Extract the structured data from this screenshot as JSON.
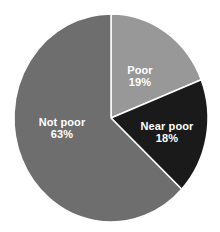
{
  "chart_data": {
    "type": "pie",
    "title": "",
    "subtitle": "",
    "xlabel": "",
    "ylabel": "",
    "legend_position": "none",
    "grid": false,
    "labels_inside_slices": true,
    "background_color": "#ffffff",
    "label_text_color": "#ffffff",
    "start_angle_deg": 0,
    "direction": "clockwise",
    "categories": [
      "Poor",
      "Near poor",
      "Not poor"
    ],
    "values": [
      19,
      18,
      63
    ],
    "value_suffix": "%",
    "colors": [
      "#989898",
      "#1a1a1a",
      "#6e6e6e"
    ],
    "slices": [
      {
        "name": "Poor",
        "value": 19,
        "value_label": "19%",
        "color": "#989898",
        "start_angle_deg": 0,
        "end_angle_deg": 68.4,
        "label_x": 140,
        "label_y": 76
      },
      {
        "name": "Near poor",
        "value": 18,
        "value_label": "18%",
        "color": "#1a1a1a",
        "start_angle_deg": 68.4,
        "end_angle_deg": 133.2,
        "label_x": 167,
        "label_y": 132
      },
      {
        "name": "Not poor",
        "value": 63,
        "value_label": "63%",
        "color": "#6e6e6e",
        "start_angle_deg": 133.2,
        "end_angle_deg": 360,
        "label_x": 62,
        "label_y": 128
      }
    ],
    "geometry": {
      "center_x": 111,
      "center_y": 118,
      "radius_x": 97,
      "radius_y": 104
    }
  }
}
